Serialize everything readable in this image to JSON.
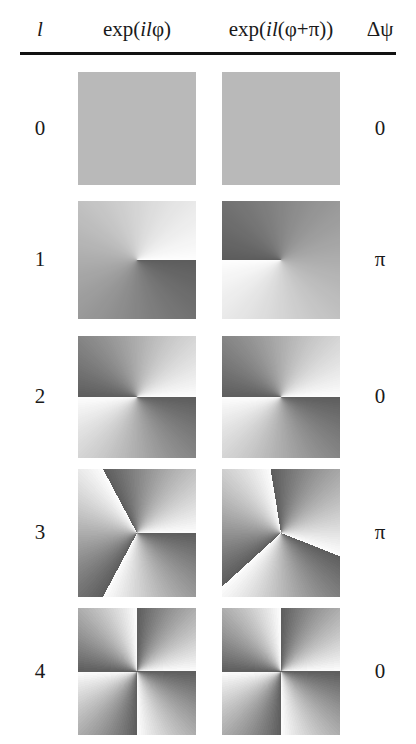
{
  "figure": {
    "type": "phase-map-table"
  },
  "header": {
    "col_l": "l",
    "col_phase_a_prefix": "exp(",
    "col_phase_a_italic": "il",
    "col_phase_a_suffix": "φ)",
    "col_phase_b_prefix": "exp(",
    "col_phase_b_italic": "il",
    "col_phase_b_suffix": "(φ+π))",
    "col_delta": "Δψ"
  },
  "chart_data": {
    "type": "heatmap",
    "title": "",
    "xlabel": "",
    "ylabel": "",
    "colormap": "grayscale-phase",
    "colormap_note": "Phase 0 maps to white, phase 2π maps to dark gray; value wraps at the discontinuity rays.",
    "columns": [
      "l",
      "exp(ilφ)",
      "exp(il(φ+π))",
      "Δψ"
    ],
    "rows": [
      {
        "l": "0",
        "l_value": 0,
        "delta_psi": "0",
        "delta_psi_value": 0,
        "panel_a": {
          "charge": 0,
          "offset_deg": 0,
          "sectors": 0,
          "uniform": true
        },
        "panel_b": {
          "charge": 0,
          "offset_deg": 180,
          "sectors": 0,
          "uniform": true
        }
      },
      {
        "l": "1",
        "l_value": 1,
        "delta_psi": "π",
        "delta_psi_value": 3.14159,
        "panel_a": {
          "charge": 1,
          "offset_deg": 0,
          "sectors": 1,
          "uniform": false
        },
        "panel_b": {
          "charge": 1,
          "offset_deg": 180,
          "sectors": 1,
          "uniform": false
        }
      },
      {
        "l": "2",
        "l_value": 2,
        "delta_psi": "0",
        "delta_psi_value": 0,
        "panel_a": {
          "charge": 2,
          "offset_deg": 0,
          "sectors": 2,
          "uniform": false
        },
        "panel_b": {
          "charge": 2,
          "offset_deg": 0,
          "sectors": 2,
          "uniform": false
        }
      },
      {
        "l": "3",
        "l_value": 3,
        "delta_psi": "π",
        "delta_psi_value": 3.14159,
        "panel_a": {
          "charge": 3,
          "offset_deg": 0,
          "sectors": 3,
          "uniform": false
        },
        "panel_b": {
          "charge": 3,
          "offset_deg": 60,
          "sectors": 3,
          "uniform": false
        }
      },
      {
        "l": "4",
        "l_value": 4,
        "delta_psi": "0",
        "delta_psi_value": 0,
        "panel_a": {
          "charge": 4,
          "offset_deg": 0,
          "sectors": 4,
          "uniform": false
        },
        "panel_b": {
          "charge": 4,
          "offset_deg": 0,
          "sectors": 4,
          "uniform": false
        }
      }
    ]
  },
  "colors": {
    "background": "#ffffff",
    "text": "#1a1a1a",
    "rule": "#111111",
    "phase_light": "#fdfdfd",
    "phase_dark": "#5d5d5d",
    "uniform_gray": "#b9b9b9"
  },
  "layout": {
    "rows_top": [
      72,
      201,
      336,
      469,
      608
    ],
    "cell_size": 118,
    "row_heights": [
      113,
      118,
      122,
      128,
      127
    ],
    "col_a_left": 78,
    "col_b_left": 222
  }
}
